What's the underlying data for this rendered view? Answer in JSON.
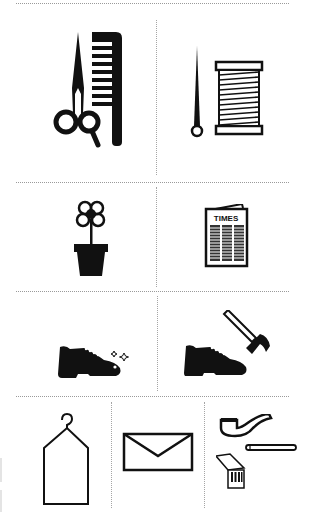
{
  "sheet": {
    "title": "Errand pictogram card sheet",
    "rows": [
      {
        "cells": [
          {
            "name": "haircut",
            "icon": "scissors-comb-icon"
          },
          {
            "name": "sewing",
            "icon": "needle-thread-icon"
          }
        ]
      },
      {
        "cells": [
          {
            "name": "florist",
            "icon": "flower-pot-icon"
          },
          {
            "name": "newspaper",
            "icon": "newspaper-icon",
            "label": "TIMES"
          }
        ]
      },
      {
        "cells": [
          {
            "name": "shoe-shine",
            "icon": "shiny-shoe-icon"
          },
          {
            "name": "shoe-repair",
            "icon": "shoe-hammer-icon"
          }
        ]
      },
      {
        "cells": [
          {
            "name": "dry-cleaning",
            "icon": "garment-hanger-icon"
          },
          {
            "name": "mail",
            "icon": "envelope-icon"
          },
          {
            "name": "tobacco",
            "icon": "pipe-cigarette-matches-icon"
          }
        ]
      }
    ]
  },
  "colors": {
    "ink": "#111111",
    "divider": "#9a9a9a",
    "background": "#ffffff"
  }
}
